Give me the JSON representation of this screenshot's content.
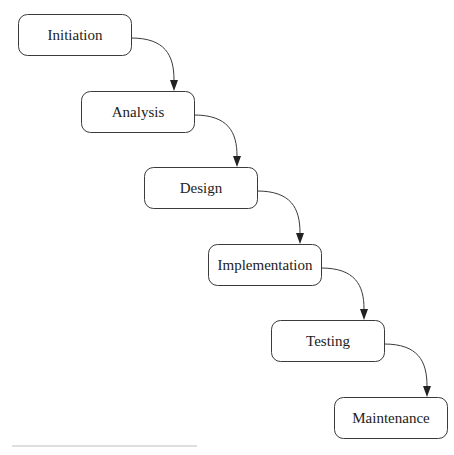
{
  "diagram": {
    "type": "waterfall-flow",
    "nodes": [
      {
        "id": "initiation",
        "label": "Initiation",
        "x": 18,
        "y": 14
      },
      {
        "id": "analysis",
        "label": "Analysis",
        "x": 81,
        "y": 91
      },
      {
        "id": "design",
        "label": "Design",
        "x": 144,
        "y": 167
      },
      {
        "id": "implementation",
        "label": "Implementation",
        "x": 208,
        "y": 244
      },
      {
        "id": "testing",
        "label": "Testing",
        "x": 271,
        "y": 320
      },
      {
        "id": "maintenance",
        "label": "Maintenance",
        "x": 334,
        "y": 397
      }
    ],
    "edges": [
      {
        "from": "initiation",
        "to": "analysis"
      },
      {
        "from": "analysis",
        "to": "design"
      },
      {
        "from": "design",
        "to": "implementation"
      },
      {
        "from": "implementation",
        "to": "testing"
      },
      {
        "from": "testing",
        "to": "maintenance"
      }
    ],
    "node_width": 113,
    "node_height": 41,
    "colors": {
      "stroke": "#3a3a3a",
      "text": "#222222",
      "background": "#ffffff"
    }
  }
}
